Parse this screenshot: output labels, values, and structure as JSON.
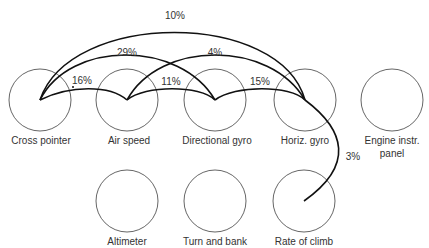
{
  "diagram": {
    "type": "instrument-panel-eye-movement-link-diagram",
    "instruments": [
      {
        "id": "cross_pointer",
        "label": "Cross pointer",
        "row": 1,
        "cx": 40,
        "cy": 100
      },
      {
        "id": "air_speed",
        "label": "Air speed",
        "row": 1,
        "cx": 127,
        "cy": 100
      },
      {
        "id": "directional_gyro",
        "label": "Directional gyro",
        "row": 1,
        "cx": 215,
        "cy": 100
      },
      {
        "id": "horiz_gyro",
        "label": "Horiz. gyro",
        "row": 1,
        "cx": 305,
        "cy": 100
      },
      {
        "id": "engine_instr_panel",
        "label_line1": "Engine instr.",
        "label_line2": "panel",
        "row": 1,
        "cx": 392,
        "cy": 100
      },
      {
        "id": "altimeter",
        "label": "Altimeter",
        "row": 2,
        "cx": 127,
        "cy": 200
      },
      {
        "id": "turn_and_bank",
        "label": "Turn and bank",
        "row": 2,
        "cx": 215,
        "cy": 200
      },
      {
        "id": "rate_of_climb",
        "label": "Rate of climb",
        "row": 2,
        "cx": 304,
        "cy": 200
      }
    ],
    "links": [
      {
        "from": "Cross pointer",
        "to": "Horiz. gyro",
        "percent": "10%"
      },
      {
        "from": "Cross pointer",
        "to": "Directional gyro",
        "percent": "29%"
      },
      {
        "from": "Cross pointer",
        "to": "Air speed",
        "percent": "16%"
      },
      {
        "from": "Air speed",
        "to": "Horiz. gyro",
        "percent": "4%"
      },
      {
        "from": "Air speed",
        "to": "Directional gyro",
        "percent": "11%"
      },
      {
        "from": "Directional gyro",
        "to": "Horiz. gyro",
        "percent": "15%"
      },
      {
        "from": "Horiz. gyro",
        "to": "Rate of climb",
        "percent": "3%"
      }
    ]
  }
}
